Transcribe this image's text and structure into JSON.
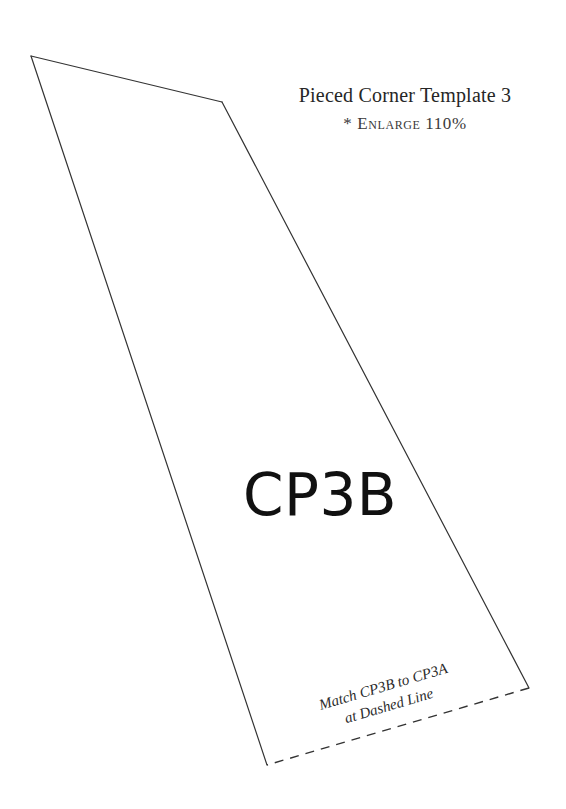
{
  "page": {
    "width": 566,
    "height": 809,
    "background_color": "#ffffff",
    "document_kind": "sewing-quilting-pattern-template"
  },
  "heading": {
    "title": "Pieced Corner Template 3",
    "enlarge_note": "* Enlarge 110%",
    "enlarge_marker": "*",
    "enlarge_word": "Enlarge",
    "enlarge_percent": "110%"
  },
  "piece": {
    "label": "CP3B"
  },
  "match_note": {
    "line1": "Match CP3B to CP3A",
    "line2": "at Dashed Line",
    "rotation_degrees": -16.4
  },
  "figure": {
    "stroke_color": "#333333",
    "fill_color": "#ffffff",
    "stroke_width": 1.2,
    "dash_pattern": "9 7",
    "vertices": [
      {
        "name": "top-apex",
        "x": 31,
        "y": 56
      },
      {
        "name": "upper-corner",
        "x": 222,
        "y": 102
      },
      {
        "name": "bottom-right",
        "x": 529,
        "y": 688
      },
      {
        "name": "bottom-left",
        "x": 267,
        "y": 765
      }
    ],
    "edges": [
      {
        "name": "top-left-edge",
        "from": "top-apex",
        "to": "upper-corner",
        "style": "solid"
      },
      {
        "name": "right-edge",
        "from": "upper-corner",
        "to": "bottom-right",
        "style": "solid"
      },
      {
        "name": "bottom-match-edge",
        "from": "bottom-right",
        "to": "bottom-left",
        "style": "dashed"
      },
      {
        "name": "left-edge",
        "from": "bottom-left",
        "to": "top-apex",
        "style": "solid"
      }
    ]
  }
}
